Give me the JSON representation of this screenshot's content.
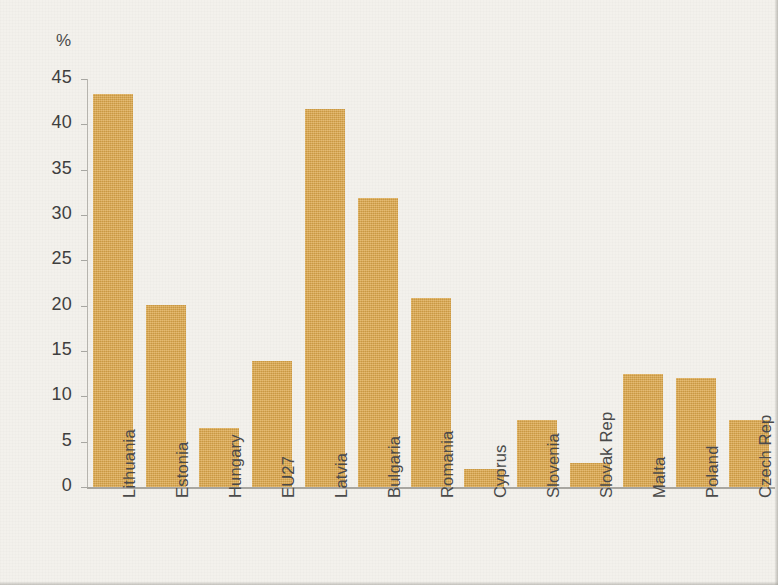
{
  "chart_data": {
    "type": "bar",
    "title": "",
    "subtitle": "",
    "xlabel": "",
    "ylabel": "%",
    "unit_label": "%",
    "ylim": [
      0,
      45
    ],
    "ytick_labels": [
      "45",
      "40",
      "35",
      "30",
      "25",
      "20",
      "15",
      "10",
      "5",
      "0"
    ],
    "ytick_values": [
      45,
      40,
      35,
      30,
      25,
      20,
      15,
      10,
      5,
      0
    ],
    "grid": false,
    "legend": null,
    "bar_color": "#dda74a",
    "background_color": "#f3f1ec",
    "axis_color": "#a8a6a0",
    "text_color": "#4a4a4a",
    "categories": [
      "Lithuania",
      "Estonia",
      "Hungary",
      "EU27",
      "Latvia",
      "Bulgaria",
      "Romania",
      "Cyprus",
      "Slovenia",
      "Slovak Rep",
      "Malta",
      "Poland",
      "Czech Rep"
    ],
    "values": [
      43.4,
      20.1,
      6.5,
      13.9,
      41.7,
      31.9,
      20.8,
      2.0,
      7.4,
      2.7,
      12.5,
      12.0,
      7.4
    ]
  }
}
